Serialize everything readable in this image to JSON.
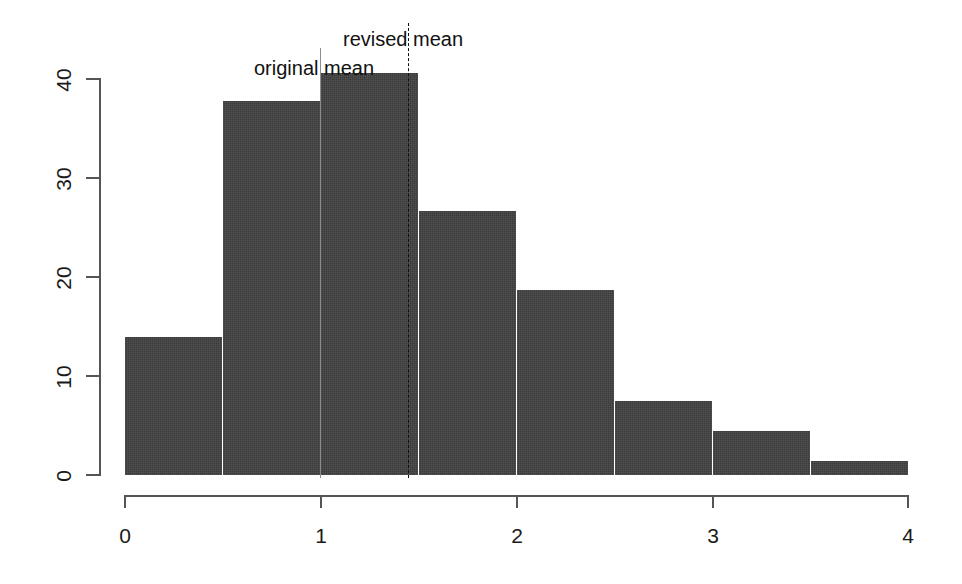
{
  "chart_data": {
    "type": "bar",
    "title": "",
    "subtitle": "",
    "xlabel": "",
    "ylabel": "",
    "xlim": [
      0,
      4
    ],
    "ylim": [
      0,
      41
    ],
    "bin_width": 0.5,
    "grid": false,
    "legend": "none",
    "bar_color": "#3b3b3b",
    "bar_border_color": "#ffffff",
    "axis_color": "#555555",
    "bins": [
      {
        "x0": 0.0,
        "x1": 0.5,
        "value": 13.9
      },
      {
        "x0": 0.5,
        "x1": 1.0,
        "value": 37.7
      },
      {
        "x0": 1.0,
        "x1": 1.5,
        "value": 40.5
      },
      {
        "x0": 1.5,
        "x1": 2.0,
        "value": 26.6
      },
      {
        "x0": 2.0,
        "x1": 2.5,
        "value": 18.6
      },
      {
        "x0": 2.5,
        "x1": 3.0,
        "value": 7.5
      },
      {
        "x0": 3.0,
        "x1": 3.5,
        "value": 4.4
      },
      {
        "x0": 3.5,
        "x1": 4.0,
        "value": 1.4
      }
    ],
    "categories": [
      "0-0.5",
      "0.5-1",
      "1-1.5",
      "1.5-2",
      "2-2.5",
      "2.5-3",
      "3-3.5",
      "3.5-4"
    ],
    "values": [
      13.9,
      37.7,
      40.5,
      26.6,
      18.6,
      7.5,
      4.4,
      1.4
    ],
    "x_ticks": [
      {
        "value": 0,
        "label": "0"
      },
      {
        "value": 1,
        "label": "1"
      },
      {
        "value": 2,
        "label": "2"
      },
      {
        "value": 3,
        "label": "3"
      },
      {
        "value": 4,
        "label": "4"
      }
    ],
    "y_ticks": [
      {
        "value": 0,
        "label": "0"
      },
      {
        "value": 10,
        "label": "10"
      },
      {
        "value": 20,
        "label": "20"
      },
      {
        "value": 30,
        "label": "30"
      },
      {
        "value": 40,
        "label": "40"
      }
    ],
    "annotations": [
      {
        "id": "original-mean",
        "label": "original mean",
        "x": 1.0,
        "line_style": "solid",
        "line_color": "#8d8d8d",
        "line_top_value": 43.0,
        "line_bottom_value": 0.0
      },
      {
        "id": "revised-mean",
        "label": "revised mean",
        "x": 1.45,
        "line_style": "dashed",
        "line_color": "#0f0f0f",
        "line_top_value": 45.5,
        "line_bottom_value": 0.0
      }
    ]
  }
}
